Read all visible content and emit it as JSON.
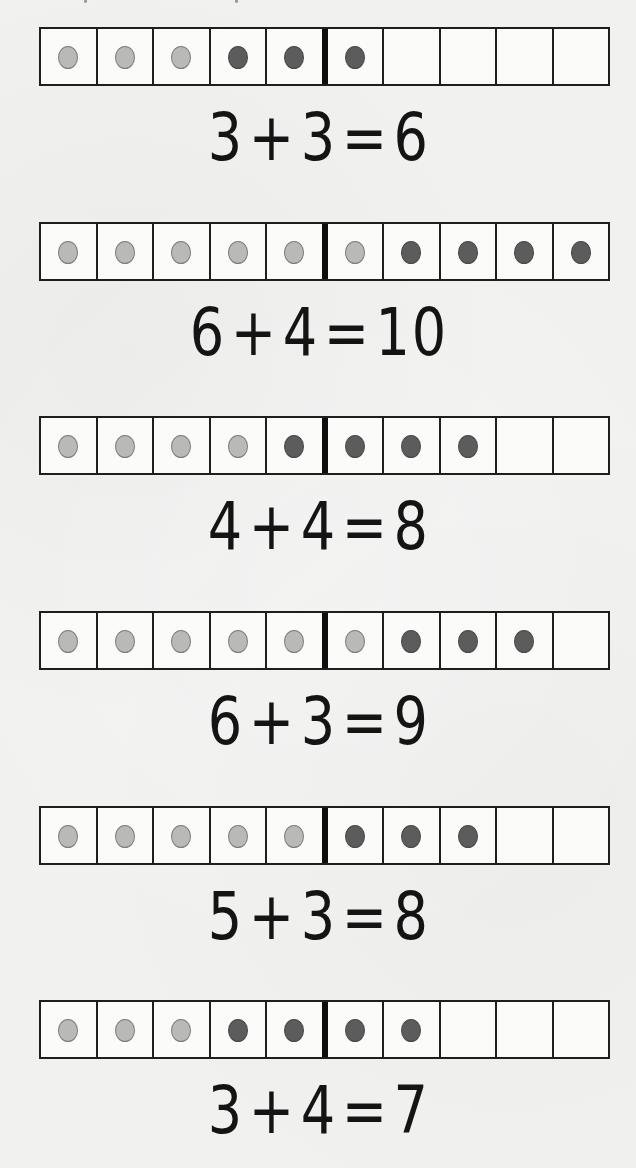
{
  "worksheet": {
    "colors": {
      "background": "#f1f1f0",
      "frame_line": "#1e1e1e",
      "divider_line": "#0e0e0e",
      "first_addend_dot": "#b9b9b7",
      "second_addend_dot": "#5c5c5c"
    },
    "frame_cells": 10,
    "problems": [
      {
        "first_addend": "3",
        "plus": "+",
        "second_addend": "3",
        "equals": "=",
        "sum": "6",
        "equation": "3 + 3 = 6",
        "light_dots": 3,
        "dark_dots": 3
      },
      {
        "first_addend": "6",
        "plus": "+",
        "second_addend": "4",
        "equals": "=",
        "sum": "10",
        "equation": "6 + 4 = 10",
        "light_dots": 6,
        "dark_dots": 4
      },
      {
        "first_addend": "4",
        "plus": "+",
        "second_addend": "4",
        "equals": "=",
        "sum": "8",
        "equation": "4 + 4 = 8",
        "light_dots": 4,
        "dark_dots": 4
      },
      {
        "first_addend": "6",
        "plus": "+",
        "second_addend": "3",
        "equals": "=",
        "sum": "9",
        "equation": "6 + 3 = 9",
        "light_dots": 6,
        "dark_dots": 3
      },
      {
        "first_addend": "5",
        "plus": "+",
        "second_addend": "3",
        "equals": "=",
        "sum": "8",
        "equation": "5 + 3 = 8",
        "light_dots": 5,
        "dark_dots": 3
      },
      {
        "first_addend": "3",
        "plus": "+",
        "second_addend": "4",
        "equals": "=",
        "sum": "7",
        "equation": "3 + 4 = 7",
        "light_dots": 3,
        "dark_dots": 4
      }
    ]
  }
}
